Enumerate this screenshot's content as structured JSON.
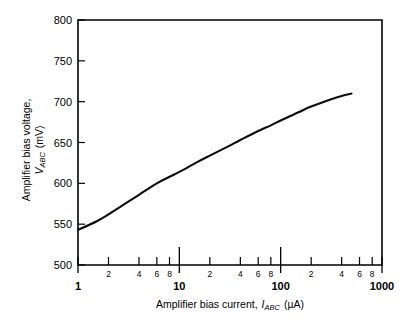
{
  "chart_data": {
    "type": "line",
    "title": "",
    "xlabel": "Amplifier bias current, I_ABC (µA)",
    "ylabel": "Amplifier bias voltage, V_ABC (mV)",
    "xscale": "log",
    "yscale": "linear",
    "xlim": [
      1,
      1000
    ],
    "ylim": [
      500,
      800
    ],
    "grid": false,
    "legend": null,
    "x_major_ticks": [
      "1",
      "10",
      "100",
      "1000"
    ],
    "x_minor_ticks": [
      "2",
      "4",
      "6",
      "8"
    ],
    "y_ticks": [
      "500",
      "550",
      "600",
      "650",
      "700",
      "750",
      "800"
    ],
    "series": [
      {
        "name": "VABC vs IABC",
        "x": [
          1,
          1.5,
          2,
          3,
          4,
          6,
          8,
          10,
          15,
          20,
          30,
          40,
          60,
          80,
          100,
          150,
          200,
          300,
          400,
          500
        ],
        "values": [
          543,
          553,
          562,
          576,
          586,
          600,
          608,
          614,
          626,
          634,
          645,
          653,
          664,
          671,
          677,
          687,
          694,
          702,
          707,
          710
        ]
      }
    ]
  },
  "axis": {
    "x_title_prefix": "Amplifier bias current,",
    "x_title_symbol": "I",
    "x_title_subscript": "ABC",
    "x_title_units": "(µA)",
    "y_title_line1": "Amplifier bias voltage,",
    "y_title_symbol": "V",
    "y_title_subscript": "ABC",
    "y_title_units": "(mV)"
  },
  "y_ticks": [
    {
      "label": "800",
      "value": 800
    },
    {
      "label": "750",
      "value": 750
    },
    {
      "label": "700",
      "value": 700
    },
    {
      "label": "650",
      "value": 650
    },
    {
      "label": "600",
      "value": 600
    },
    {
      "label": "550",
      "value": 550
    },
    {
      "label": "500",
      "value": 500
    }
  ],
  "x_decades": [
    {
      "label": "1",
      "value": 1
    },
    {
      "label": "10",
      "value": 10
    },
    {
      "label": "100",
      "value": 100
    },
    {
      "label": "1000",
      "value": 1000
    }
  ],
  "x_minor_decade1": [
    {
      "label": "2",
      "value": 2
    },
    {
      "label": "4",
      "value": 4
    },
    {
      "label": "6",
      "value": 6
    },
    {
      "label": "8",
      "value": 8
    }
  ],
  "x_minor_decade2": [
    {
      "label": "2",
      "value": 20
    },
    {
      "label": "4",
      "value": 40
    },
    {
      "label": "6",
      "value": 60
    },
    {
      "label": "8",
      "value": 80
    }
  ],
  "x_minor_decade3": [
    {
      "label": "2",
      "value": 200
    },
    {
      "label": "4",
      "value": 400
    },
    {
      "label": "6",
      "value": 600
    },
    {
      "label": "8",
      "value": 800
    }
  ],
  "colors": {
    "curve": "#0d0d0d",
    "axis": "#000000",
    "background": "#ffffff"
  }
}
